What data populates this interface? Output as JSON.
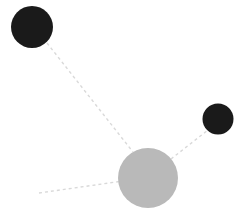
{
  "canvas": {
    "width": 246,
    "height": 218,
    "background": "#ffffff",
    "title": "molecular bond diagram"
  },
  "palette": {
    "atom_dark": "#1a1a1a",
    "atom_gray": "#b9b9b9",
    "bond_line": "#d9d9d9"
  },
  "chart_data": {
    "type": "scatter",
    "title": "",
    "xlabel": "",
    "ylabel": "",
    "xlim": [
      0,
      246
    ],
    "ylim": [
      0,
      218
    ],
    "grid": false,
    "legend": false,
    "nodes": [
      {
        "id": "atom-top-left",
        "label": "dark atom upper left",
        "cx": 32,
        "cy": 27,
        "r": 21,
        "color": "#1a1a1a"
      },
      {
        "id": "atom-right",
        "label": "dark atom right",
        "cx": 218,
        "cy": 119,
        "r": 15.5,
        "color": "#1a1a1a"
      },
      {
        "id": "atom-center",
        "label": "gray atom center",
        "cx": 148,
        "cy": 178,
        "r": 30,
        "color": "#b9b9b9"
      }
    ],
    "edges": [
      {
        "id": "bond-center-to-top-left",
        "label": "dashed bond to upper left atom",
        "x1": 47,
        "y1": 43,
        "x2": 133,
        "y2": 152,
        "color": "#d9d9d9",
        "width": 1.4,
        "dash": "3 3"
      },
      {
        "id": "bond-center-to-right",
        "label": "dashed bond to right atom",
        "x1": 171,
        "y1": 159,
        "x2": 208,
        "y2": 130,
        "color": "#d9d9d9",
        "width": 1.4,
        "dash": "3 3"
      },
      {
        "id": "bond-center-to-lower-left",
        "label": "dashed bond to lower left open end",
        "x1": 39,
        "y1": 193,
        "x2": 123,
        "y2": 181,
        "color": "#d9d9d9",
        "width": 1.4,
        "dash": "3 3"
      }
    ]
  }
}
